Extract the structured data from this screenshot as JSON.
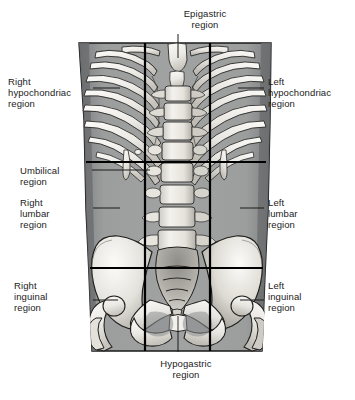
{
  "figure": {
    "colors": {
      "background": "#ffffff",
      "body_fill": "#9a9b9b",
      "body_shadow": "#6e6f70",
      "bone_fill": "#f2f1ee",
      "bone_shade": "#b9b7b2",
      "outline": "#141414",
      "grid_line": "#000000",
      "leader_line": "#1b1b1b",
      "text": "#1b1b1b"
    }
  },
  "labels": {
    "epigastric": "Epigastric\nregion",
    "right_hypochondriac": "Right\nhypochondriac\nregion",
    "left_hypochondriac": "Left\nhypochondriac\nregion",
    "umbilical": "Umbilical\nregion",
    "right_lumbar": "Right\nlumbar\nregion",
    "left_lumbar": "Left\nlumbar\nregion",
    "right_inguinal": "Right\ninguinal\nregion",
    "left_inguinal": "Left\ninguinal\nregion",
    "hypogastric": "Hypogastric\nregion"
  },
  "grid": {
    "vertical_lines_x": [
      145,
      210
    ],
    "horizontal_lines_y": [
      162,
      268
    ],
    "line_width": 2.2
  },
  "anatomy": {
    "torso": {
      "top_y": 43,
      "bottom_y": 350,
      "left_x": 78,
      "right_x": 272
    },
    "structures": [
      "ribcage",
      "sternum",
      "costal-cartilage",
      "lumbar-vertebrae",
      "sacrum",
      "coccyx",
      "ilium",
      "pubis",
      "ischium",
      "femur-head"
    ]
  }
}
